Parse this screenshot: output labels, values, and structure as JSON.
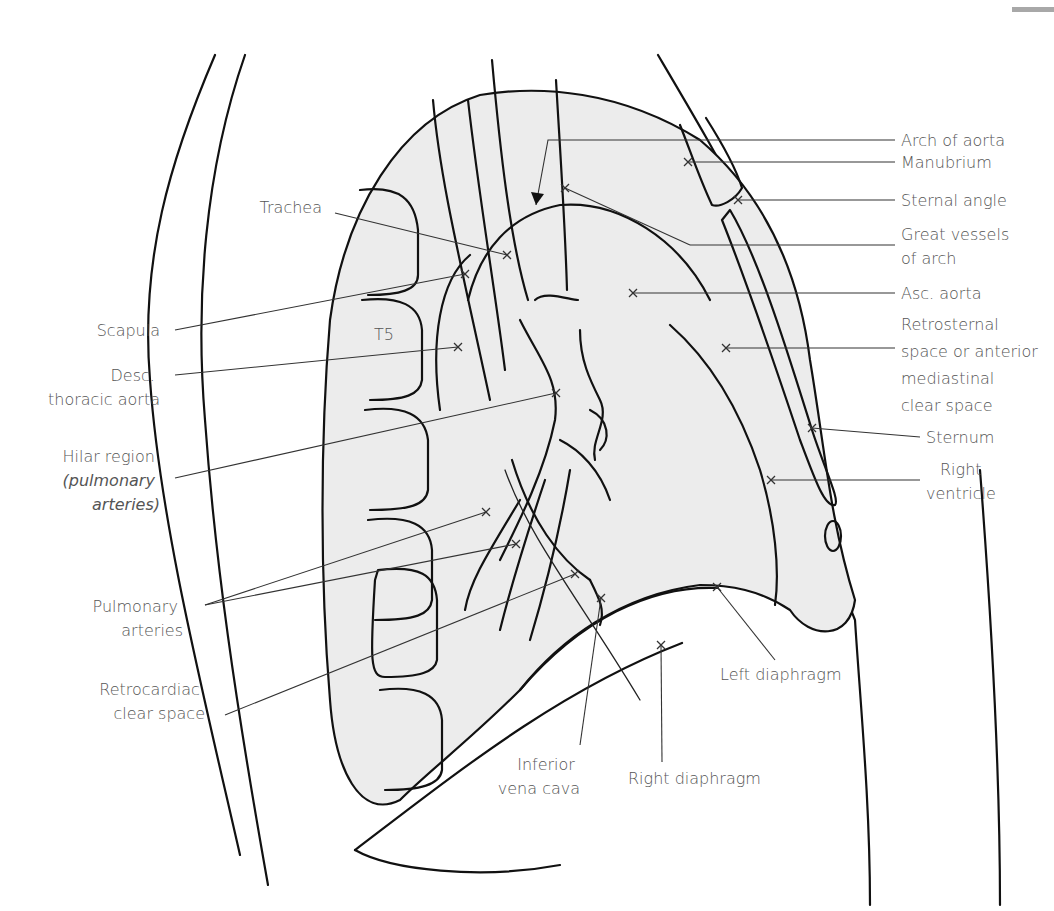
{
  "figure": {
    "colors": {
      "lung_fill": "#ececec",
      "line": "#111111",
      "label_text": "#555555",
      "corner_bar": "#a8a8a8"
    },
    "vertebra_label": "T5",
    "labels": [
      {
        "id": "arch-of-aorta",
        "lines": [
          "Arch of aorta"
        ],
        "side": "right"
      },
      {
        "id": "manubrium",
        "lines": [
          "Manubrium"
        ],
        "side": "right"
      },
      {
        "id": "sternal-angle",
        "lines": [
          "Sternal angle"
        ],
        "side": "right"
      },
      {
        "id": "great-vessels",
        "lines": [
          "Great vessels",
          "of arch"
        ],
        "side": "right"
      },
      {
        "id": "asc-aorta",
        "lines": [
          "Asc. aorta"
        ],
        "side": "right"
      },
      {
        "id": "retrosternal",
        "lines": [
          "Retrosternal",
          "space or anterior",
          "mediastinal",
          "clear space"
        ],
        "side": "right"
      },
      {
        "id": "sternum",
        "lines": [
          "Sternum"
        ],
        "side": "right"
      },
      {
        "id": "right-ventricle",
        "lines": [
          "Right",
          "ventricle"
        ],
        "side": "right"
      },
      {
        "id": "left-diaphragm",
        "lines": [
          "Left diaphragm"
        ],
        "side": "bottom"
      },
      {
        "id": "right-diaphragm",
        "lines": [
          "Right diaphragm"
        ],
        "side": "bottom"
      },
      {
        "id": "inferior-vena-cava",
        "lines": [
          "Inferior",
          "vena cava"
        ],
        "side": "bottom"
      },
      {
        "id": "trachea",
        "lines": [
          "Trachea"
        ],
        "side": "left"
      },
      {
        "id": "scapula",
        "lines": [
          "Scapula"
        ],
        "side": "left"
      },
      {
        "id": "desc-thoracic-aorta",
        "lines": [
          "Desc.",
          "thoracic aorta"
        ],
        "side": "left"
      },
      {
        "id": "hilar-region",
        "lines": [
          "Hilar region",
          "(pulmonary",
          "arteries)"
        ],
        "side": "left"
      },
      {
        "id": "pulmonary-arteries",
        "lines": [
          "Pulmonary",
          "arteries"
        ],
        "side": "left"
      },
      {
        "id": "retrocardiac",
        "lines": [
          "Retrocardiac",
          "clear space"
        ],
        "side": "left"
      }
    ]
  }
}
